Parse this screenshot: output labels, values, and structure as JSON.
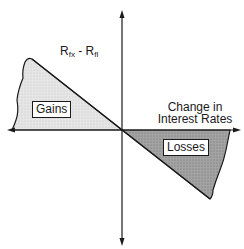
{
  "diagram": {
    "y_axis_label": {
      "main1": "R",
      "sub1": "fx",
      "sep": " - ",
      "main2": "R",
      "sub2": "fl"
    },
    "x_axis_label": {
      "line1": "Change in",
      "line2": "Interest Rates"
    },
    "regions": [
      {
        "label": "Gains",
        "quadrant": "upper-left",
        "fill": "#e3e3e3"
      },
      {
        "label": "Losses",
        "quadrant": "lower-right",
        "fill": "#9a9a9a"
      }
    ],
    "colors": {
      "line": "#1a1a1a",
      "gains_fill": "#e3e3e3",
      "losses_fill": "#9a9a9a"
    }
  }
}
